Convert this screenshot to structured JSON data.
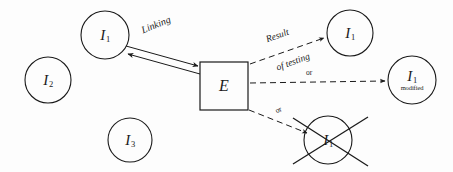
{
  "diagram": {
    "background_color": "#fdfdfd",
    "stroke_color": "#1a1a1a",
    "nodes": [
      {
        "id": "i1-top-left",
        "name": "node-i1-top-left",
        "shape": "circle",
        "symbol": "I",
        "subscript": "1",
        "note": "",
        "cx": 105,
        "cy": 35,
        "r": 24
      },
      {
        "id": "i2-left",
        "name": "node-i2-left",
        "shape": "circle",
        "symbol": "I",
        "subscript": "2",
        "note": "",
        "cx": 48,
        "cy": 80,
        "r": 23
      },
      {
        "id": "i3-bottom-left",
        "name": "node-i3-bottom-left",
        "shape": "circle",
        "symbol": "I",
        "subscript": "3",
        "note": "",
        "cx": 130,
        "cy": 140,
        "r": 22
      },
      {
        "id": "e-box",
        "name": "node-e-box",
        "shape": "square",
        "symbol": "E",
        "subscript": "",
        "note": "",
        "x": 200,
        "y": 62,
        "width": 48,
        "height": 48
      },
      {
        "id": "i1-top-right",
        "name": "node-i1-top-right",
        "shape": "circle",
        "symbol": "I",
        "subscript": "1",
        "note": "",
        "cx": 350,
        "cy": 33,
        "r": 23
      },
      {
        "id": "i1-modified",
        "name": "node-i1-modified",
        "shape": "circle",
        "symbol": "I",
        "subscript": "1",
        "note": "modified",
        "cx": 412,
        "cy": 80,
        "r": 24
      },
      {
        "id": "i1-deleted",
        "name": "node-i1-deleted",
        "shape": "circle-crossed",
        "symbol": "I",
        "subscript": "1",
        "note": "",
        "cx": 328,
        "cy": 140,
        "r": 24
      }
    ],
    "edges": [
      {
        "id": "linking",
        "name": "edge-linking",
        "label": "Linking",
        "style": "solid-bidirectional",
        "label_rotation": -22
      },
      {
        "id": "result-of-testing",
        "name": "edge-result-of-testing",
        "label_line1": "Result",
        "label_line2": "of testing",
        "style": "dashed-arrow",
        "label_rotation": -20
      },
      {
        "id": "or-modified",
        "name": "edge-or-modified",
        "label": "or",
        "style": "dashed-arrow",
        "label_rotation": 0
      },
      {
        "id": "or-deleted",
        "name": "edge-or-deleted",
        "label": "or",
        "style": "dashed-arrow",
        "label_rotation": -27
      }
    ]
  }
}
